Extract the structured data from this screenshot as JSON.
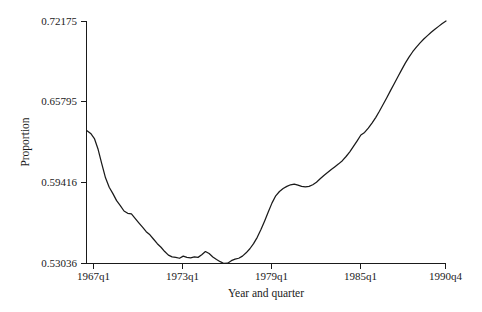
{
  "chart_data": {
    "type": "line",
    "title": "",
    "subtitle": "",
    "xlabel": "Year and quarter",
    "ylabel": "Proportion",
    "grid": false,
    "legend": "none",
    "xlim": [
      "1966q3",
      "1990q4"
    ],
    "ylim": [
      0.53036,
      0.72175
    ],
    "ytick_labels": [
      "0.53036",
      "0.59416",
      "0.65795",
      "0.72175"
    ],
    "ytick_values": [
      0.53036,
      0.59416,
      0.65795,
      0.72175
    ],
    "xtick_labels": [
      "1967q1",
      "1973q1",
      "1979q1",
      "1985q1",
      "1990q4"
    ],
    "xtick_index": [
      2,
      26,
      50,
      74,
      97
    ],
    "x": [
      "1966q3",
      "1966q4",
      "1967q1",
      "1967q2",
      "1967q3",
      "1967q4",
      "1968q1",
      "1968q2",
      "1968q3",
      "1968q4",
      "1969q1",
      "1969q2",
      "1969q3",
      "1969q4",
      "1970q1",
      "1970q2",
      "1970q3",
      "1970q4",
      "1971q1",
      "1971q2",
      "1971q3",
      "1971q4",
      "1972q1",
      "1972q2",
      "1972q3",
      "1972q4",
      "1973q1",
      "1973q2",
      "1973q3",
      "1973q4",
      "1974q1",
      "1974q2",
      "1974q3",
      "1974q4",
      "1975q1",
      "1975q2",
      "1975q3",
      "1975q4",
      "1976q1",
      "1976q2",
      "1976q3",
      "1976q4",
      "1977q1",
      "1977q2",
      "1977q3",
      "1977q4",
      "1978q1",
      "1978q2",
      "1978q3",
      "1978q4",
      "1979q1",
      "1979q2",
      "1979q3",
      "1979q4",
      "1980q1",
      "1980q2",
      "1980q3",
      "1980q4",
      "1981q1",
      "1981q2",
      "1981q3",
      "1981q4",
      "1982q1",
      "1982q2",
      "1982q3",
      "1982q4",
      "1983q1",
      "1983q2",
      "1983q3",
      "1983q4",
      "1984q1",
      "1984q2",
      "1984q3",
      "1984q4",
      "1985q1",
      "1985q2",
      "1985q3",
      "1985q4",
      "1986q1",
      "1986q2",
      "1986q3",
      "1986q4",
      "1987q1",
      "1987q2",
      "1987q3",
      "1987q4",
      "1988q1",
      "1988q2",
      "1988q3",
      "1988q4",
      "1989q1",
      "1989q2",
      "1989q3",
      "1989q4",
      "1990q1",
      "1990q2",
      "1990q3",
      "1990q4"
    ],
    "values": [
      0.6352,
      0.633,
      0.629,
      0.6205,
      0.609,
      0.598,
      0.5905,
      0.5855,
      0.58,
      0.576,
      0.5718,
      0.57,
      0.5695,
      0.566,
      0.5625,
      0.559,
      0.5555,
      0.553,
      0.5495,
      0.546,
      0.5432,
      0.5398,
      0.537,
      0.5356,
      0.5352,
      0.5345,
      0.5362,
      0.5352,
      0.5348,
      0.5356,
      0.5352,
      0.5372,
      0.5398,
      0.5382,
      0.5355,
      0.5335,
      0.5318,
      0.5304,
      0.5306,
      0.5326,
      0.5338,
      0.5345,
      0.5362,
      0.5388,
      0.542,
      0.546,
      0.551,
      0.5572,
      0.564,
      0.5712,
      0.5782,
      0.5838,
      0.5872,
      0.5895,
      0.5912,
      0.5925,
      0.593,
      0.5922,
      0.5912,
      0.5908,
      0.5912,
      0.5925,
      0.5945,
      0.5972,
      0.5998,
      0.6022,
      0.6045,
      0.6068,
      0.609,
      0.6115,
      0.6148,
      0.6185,
      0.6228,
      0.6272,
      0.6318,
      0.6338,
      0.6372,
      0.6412,
      0.6455,
      0.6505,
      0.6558,
      0.6612,
      0.6668,
      0.6722,
      0.6778,
      0.6832,
      0.6885,
      0.6932,
      0.6975,
      0.7012,
      0.7045,
      0.7075,
      0.7102,
      0.7128,
      0.7152,
      0.7175,
      0.7198,
      0.72175
    ]
  },
  "colors": {
    "line": "#1a1a1a",
    "axis": "#1a1a1a",
    "background": "#ffffff"
  }
}
